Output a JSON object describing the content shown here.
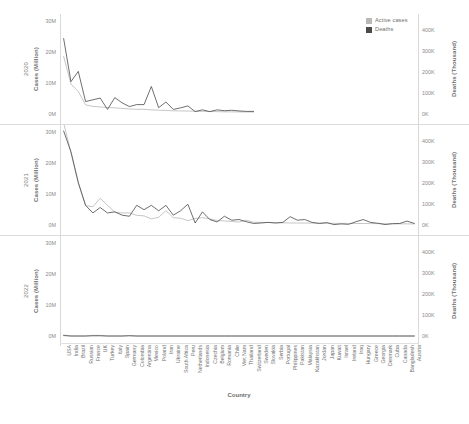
{
  "legend": {
    "items": [
      {
        "label": "Active cases",
        "color": "#b8b8b8",
        "icon": "square-swatch-icon"
      },
      {
        "label": "Deaths",
        "color": "#4a4a4a",
        "icon": "square-swatch-icon"
      }
    ]
  },
  "axes": {
    "x_title": "Country",
    "left_title": "Cases (Million)",
    "right_title": "Deaths (Thousand)",
    "left_ticks": [
      "30M",
      "20M",
      "10M",
      "0M"
    ],
    "right_ticks": [
      "400K",
      "300K",
      "200K",
      "100K",
      "0K"
    ],
    "left_range": [
      0,
      32
    ],
    "right_range": [
      0,
      430
    ]
  },
  "facets": [
    "2020",
    "2021",
    "2022"
  ],
  "chart_data": {
    "type": "line",
    "title": "",
    "subtitle": "",
    "xlabel": "Country",
    "ylabel": "Cases (Million)",
    "y2label": "Deaths (Thousand)",
    "ylim": [
      0,
      32
    ],
    "y2lim": [
      0,
      430
    ],
    "grid": false,
    "legend_position": "top-right",
    "categories": [
      "USA",
      "India",
      "Brazil",
      "Russian",
      "France",
      "UK",
      "Turkey",
      "Italy",
      "Spain",
      "Germany",
      "Colombia",
      "Argentina",
      "Mexico",
      "Poland",
      "Iran",
      "Ukraine",
      "South Africa",
      "Peru",
      "Netherlands",
      "Indonesia",
      "Czechia",
      "Belgium",
      "Romania",
      "Chile",
      "Viet Nam",
      "Thailand",
      "Switzerland",
      "Sweden",
      "Slovakia",
      "Serbia",
      "Portugal",
      "Philippines",
      "Pakistan",
      "Malaysia",
      "Kazakhstan",
      "Jordan",
      "Japan",
      "Kuwait",
      "Israel",
      "Ireland",
      "Iraq",
      "Hungary",
      "Greece",
      "Georgia",
      "Denmark",
      "Cuba",
      "Canada",
      "Bangladesh",
      "Austria"
    ],
    "facet_series": [
      {
        "facet": "2020",
        "series": [
          {
            "name": "Active cases",
            "axis": "left",
            "unit": "Million",
            "color": "#b8b8b8",
            "values": [
              19.6,
              10.2,
              7.7,
              3.1,
              2.6,
              2.4,
              2.2,
              2.1,
              1.9,
              1.7,
              1.6,
              1.6,
              1.4,
              1.3,
              1.2,
              1.1,
              1.05,
              1.0,
              0.95,
              0.9,
              0.85,
              0.8,
              0.75,
              0.72,
              0.7,
              0.68,
              0.66,
              null,
              null,
              null,
              null,
              null,
              null,
              null,
              null,
              null,
              null,
              null,
              null,
              null,
              null,
              null,
              null,
              null,
              null,
              null,
              null,
              null,
              null
            ]
          },
          {
            "name": "Deaths",
            "axis": "right",
            "unit": "Thousand",
            "color": "#4a4a4a",
            "values": [
              345,
              148,
              195,
              57,
              65,
              73,
              21,
              75,
              51,
              34,
              43,
              43,
              126,
              29,
              55,
              21,
              28,
              37,
              11,
              19,
              11,
              19,
              15,
              17,
              14,
              12,
              12,
              null,
              null,
              null,
              null,
              null,
              null,
              null,
              null,
              null,
              null,
              null,
              null,
              null,
              null,
              null,
              null,
              null,
              null,
              null,
              null,
              null,
              null
            ]
          }
        ]
      },
      {
        "facet": "2021",
        "series": [
          {
            "name": "Active cases",
            "axis": "left",
            "unit": "Million",
            "color": "#b8b8b8",
            "values": [
              34.8,
              24.6,
              14.2,
              6.6,
              6.2,
              9.1,
              6.7,
              4.4,
              4.1,
              4.1,
              3.3,
              3.1,
              2.1,
              2.6,
              4.9,
              2.5,
              2.3,
              1.5,
              2.2,
              2.5,
              2.1,
              1.5,
              1.4,
              1.2,
              1.0,
              1.6,
              0.95,
              0.9,
              0.85,
              0.8,
              0.75,
              0.7,
              0.68,
              0.66,
              0.64,
              0.62,
              0.6,
              0.58,
              0.56,
              0.54,
              0.52,
              0.5,
              0.48,
              0.46,
              0.44,
              0.42,
              0.4,
              0.38,
              0.36
            ]
          },
          {
            "name": "Deaths",
            "axis": "right",
            "unit": "Thousand",
            "color": "#4a4a4a",
            "values": [
              430,
              335,
              195,
              90,
              55,
              80,
              55,
              60,
              45,
              40,
              90,
              70,
              90,
              65,
              90,
              45,
              65,
              95,
              9,
              60,
              25,
              14,
              40,
              22,
              25,
              15,
              7,
              9,
              12,
              9,
              12,
              38,
              22,
              25,
              12,
              7,
              11,
              2,
              5,
              3,
              15,
              25,
              12,
              8,
              2,
              6,
              7,
              18,
              7
            ]
          }
        ]
      },
      {
        "facet": "2022",
        "series": [
          {
            "name": "Active cases",
            "axis": "left",
            "unit": "Million",
            "color": "#b8b8b8",
            "values": [
              0.35,
              0,
              0,
              0,
              0.22,
              0.2,
              0,
              0,
              0,
              0.15,
              0,
              0,
              0,
              0,
              0,
              0,
              0,
              0,
              0,
              0,
              0,
              0,
              0,
              0,
              0,
              0,
              0,
              0,
              0,
              0,
              0,
              0,
              0,
              0,
              0,
              0,
              0,
              0,
              0,
              0,
              0,
              0,
              0,
              0,
              0,
              0,
              0,
              0,
              0
            ]
          },
          {
            "name": "Deaths",
            "axis": "right",
            "unit": "Thousand",
            "color": "#4a4a4a",
            "values": [
              2,
              0,
              0,
              0,
              1,
              1,
              0,
              0,
              0,
              1,
              0,
              0,
              0,
              0,
              0,
              0,
              0,
              0,
              0,
              0,
              0,
              0,
              0,
              0,
              0,
              0,
              0,
              0,
              0,
              0,
              0,
              0,
              0,
              0,
              0,
              0,
              0,
              0,
              0,
              0,
              0,
              0,
              0,
              0,
              0,
              0,
              0,
              0,
              0
            ]
          }
        ]
      }
    ]
  }
}
